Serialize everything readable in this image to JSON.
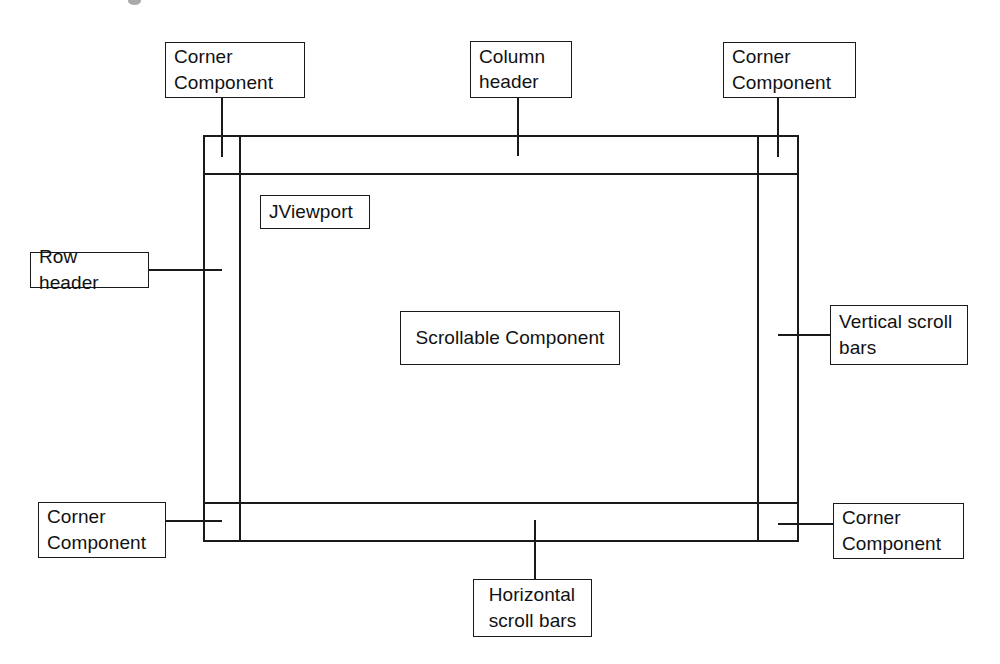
{
  "diagram": {
    "stroke_color": "#1a1a1a",
    "background_color": "#ffffff",
    "frame": {
      "label": "scroll-pane-frame",
      "x": 204,
      "y": 136,
      "width": 594,
      "height": 405
    },
    "inner_lines": {
      "row_header_divider_x": 240,
      "vertical_scrollbar_divider_x": 758,
      "column_header_divider_y": 174,
      "horizontal_scrollbar_divider_y": 503
    },
    "boxes": [
      {
        "id": "corner-top-left",
        "name": "corner-component-top-left",
        "text": "Corner\nComponent",
        "x": 165,
        "y": 42,
        "width": 140,
        "height": 56,
        "align": "left"
      },
      {
        "id": "column-header",
        "name": "column-header",
        "text": "Column\nheader",
        "x": 470,
        "y": 41,
        "width": 102,
        "height": 57,
        "align": "left"
      },
      {
        "id": "corner-top-right",
        "name": "corner-component-top-right",
        "text": "Corner\nComponent",
        "x": 723,
        "y": 42,
        "width": 133,
        "height": 56,
        "align": "left"
      },
      {
        "id": "jviewport",
        "name": "jviewport",
        "text": "JViewport",
        "x": 260,
        "y": 195,
        "width": 110,
        "height": 34,
        "align": "left"
      },
      {
        "id": "row-header",
        "name": "row-header",
        "text": "Row header",
        "x": 30,
        "y": 252,
        "width": 119,
        "height": 36,
        "align": "left"
      },
      {
        "id": "scrollable-component",
        "name": "scrollable-component",
        "text": "Scrollable Component",
        "x": 400,
        "y": 311,
        "width": 220,
        "height": 54,
        "align": "center"
      },
      {
        "id": "vertical-scroll-bars",
        "name": "vertical-scroll-bars",
        "text": "Vertical scroll\nbars",
        "x": 830,
        "y": 305,
        "width": 138,
        "height": 60,
        "align": "left"
      },
      {
        "id": "corner-bottom-left",
        "name": "corner-component-bottom-left",
        "text": "Corner\nComponent",
        "x": 38,
        "y": 502,
        "width": 128,
        "height": 56,
        "align": "left"
      },
      {
        "id": "corner-bottom-right",
        "name": "corner-component-bottom-right",
        "text": "Corner\nComponent",
        "x": 833,
        "y": 503,
        "width": 131,
        "height": 56,
        "align": "left"
      },
      {
        "id": "horizontal-scroll-bars",
        "name": "horizontal-scroll-bars",
        "text": "Horizontal\nscroll bars",
        "x": 473,
        "y": 579,
        "width": 119,
        "height": 58,
        "align": "center"
      }
    ],
    "leader_lines": [
      {
        "name": "leader-corner-top-left",
        "x1": 222,
        "y1": 98,
        "x2": 222,
        "y2": 157
      },
      {
        "name": "leader-column-header",
        "x1": 518,
        "y1": 98,
        "x2": 518,
        "y2": 156
      },
      {
        "name": "leader-corner-top-right",
        "x1": 778,
        "y1": 98,
        "x2": 778,
        "y2": 157
      },
      {
        "name": "leader-row-header",
        "x1": 149,
        "y1": 270,
        "x2": 222,
        "y2": 270
      },
      {
        "name": "leader-vertical-scroll-bars",
        "x1": 778,
        "y1": 335,
        "x2": 830,
        "y2": 335
      },
      {
        "name": "leader-corner-bottom-left",
        "x1": 166,
        "y1": 521,
        "x2": 222,
        "y2": 521
      },
      {
        "name": "leader-corner-bottom-right",
        "x1": 778,
        "y1": 524,
        "x2": 833,
        "y2": 524
      },
      {
        "name": "leader-horizontal-scroll-bars",
        "x1": 535,
        "y1": 520,
        "x2": 535,
        "y2": 579
      }
    ]
  }
}
